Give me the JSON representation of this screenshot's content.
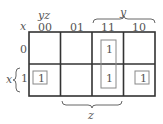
{
  "kmap": {
    "row_variable": "x",
    "col_variables": "yz",
    "col_labels": [
      "00",
      "01",
      "11",
      "10"
    ],
    "row_labels": [
      "0",
      "1"
    ],
    "cells": [
      [
        "",
        "",
        "1",
        ""
      ],
      [
        "1",
        "",
        "1",
        "1"
      ]
    ],
    "brace_labels": {
      "y": "y",
      "z": "z",
      "x": "x"
    },
    "groups": [
      {
        "cells": [
          [
            0,
            2
          ],
          [
            1,
            2
          ]
        ],
        "description": "vertical pair in column 11"
      },
      {
        "cells": [
          [
            1,
            0
          ]
        ],
        "description": "single cell x=1, yz=00"
      },
      {
        "cells": [
          [
            1,
            3
          ]
        ],
        "description": "single cell x=1, yz=10"
      }
    ]
  }
}
